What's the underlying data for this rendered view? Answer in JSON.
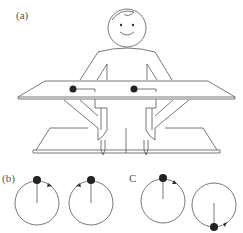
{
  "panels": {
    "a": {
      "label": "(a)",
      "description": "person seated at table holding two styluses under table; two dots with handles on table surface"
    },
    "b": {
      "label": "(b)",
      "circles": [
        {
          "dot": "top",
          "arrow": "clockwise"
        },
        {
          "dot": "top",
          "arrow": "counterclockwise"
        }
      ]
    },
    "c": {
      "label": "C",
      "circles": [
        {
          "dot": "top",
          "arrow": "clockwise"
        },
        {
          "dot": "bottom",
          "arrow": "counterclockwise"
        }
      ]
    }
  },
  "colors": {
    "line": "#555555",
    "dot": "#222222",
    "background": "#ffffff"
  }
}
